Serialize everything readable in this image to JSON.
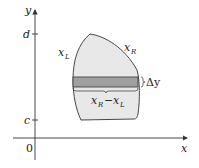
{
  "diagram": {
    "axes": {
      "x_label": "x",
      "y_label": "y",
      "origin_label": "0",
      "y_ticks": [
        {
          "label": "d"
        },
        {
          "label": "c"
        }
      ]
    },
    "region": {
      "left_boundary_label": "x",
      "left_boundary_sub": "L",
      "right_boundary_label": "x",
      "right_boundary_sub": "R"
    },
    "strip": {
      "height_label": "Δy",
      "width_label_a": "x",
      "width_label_a_sub": "R",
      "width_label_op": "−",
      "width_label_b": "x",
      "width_label_b_sub": "L"
    },
    "colors": {
      "region_fill": "#e8e8e8",
      "strip_fill": "#a0a0a0",
      "stroke": "#333333"
    }
  }
}
